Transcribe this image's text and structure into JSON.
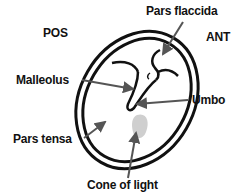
{
  "diagram": {
    "orientation": {
      "posterior": "POS",
      "anterior": "ANT"
    },
    "labels": {
      "pars_flaccida": "Pars flaccida",
      "malleolus": "Malleolus",
      "umbo": "Umbo",
      "pars_tensa": "Pars tensa",
      "cone_of_light": "Cone of light"
    },
    "colors": {
      "outline": "#111111",
      "arrow": "#555555",
      "cone_of_light_fill": "#cfcfcf",
      "text": "#111111"
    }
  }
}
